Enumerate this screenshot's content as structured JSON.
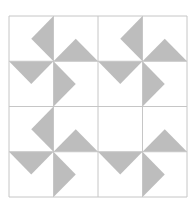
{
  "diagram": {
    "type": "quilt-pinwheel-grid",
    "colors": {
      "background": "#ffffff",
      "grid_line": "#c6c6c6",
      "triangle_fill": "#bdbdbd"
    },
    "grid": {
      "x0": 9,
      "y0": 16,
      "x1": 187,
      "y1": 197,
      "divisions": 4
    },
    "pinwheels": [
      {
        "id": "top-left",
        "cell": [
          1,
          1
        ],
        "triangles": [
          "upper-left",
          "upper-right",
          "lower-left",
          "lower-right"
        ]
      },
      {
        "id": "top-right",
        "cell": [
          3,
          1
        ],
        "triangles": [
          "upper-left",
          "upper-right",
          "lower-left",
          "lower-right"
        ]
      },
      {
        "id": "bottom-left",
        "cell": [
          1,
          3
        ],
        "triangles": [
          "upper-left",
          "upper-right",
          "lower-left",
          "lower-right"
        ]
      },
      {
        "id": "bottom-right",
        "cell": [
          3,
          3
        ],
        "triangles": [
          "upper-right",
          "lower-left",
          "lower-right"
        ]
      }
    ]
  }
}
